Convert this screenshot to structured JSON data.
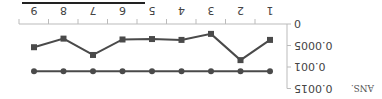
{
  "chart_data": {
    "type": "line",
    "title": "",
    "xlabel": "",
    "ylabel": "ANS.",
    "categories": [
      "1",
      "2",
      "3",
      "4",
      "5",
      "6",
      "7",
      "8",
      "9"
    ],
    "ylim": [
      0,
      0.0015
    ],
    "yticks": [
      "0",
      "0.0005",
      "0.001",
      "0.0015"
    ],
    "grid": false,
    "orientation_note": "rendered rotated 180 degrees",
    "series": [
      {
        "name": "series-squares",
        "marker": "square",
        "values": [
          0.00037,
          0.00084,
          0.00023,
          0.00037,
          0.00035,
          0.00036,
          0.00072,
          0.00034,
          0.00054
        ]
      },
      {
        "name": "series-circles",
        "marker": "circle",
        "values": [
          0.0011,
          0.0011,
          0.0011,
          0.0011,
          0.0011,
          0.0011,
          0.0011,
          0.0011,
          0.0011
        ]
      }
    ]
  },
  "colors": {
    "line": "#4a4a4a",
    "axis": "#bbbbbb",
    "text": "#444444"
  }
}
